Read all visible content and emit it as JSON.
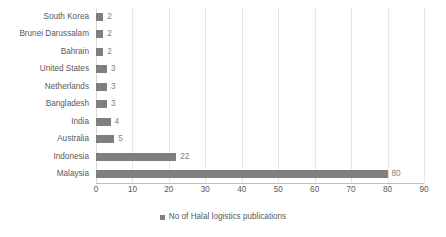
{
  "chart_data": {
    "type": "bar",
    "orientation": "horizontal",
    "title": "",
    "xlabel": "",
    "ylabel": "",
    "xlim": [
      0,
      90
    ],
    "xticks": [
      0,
      10,
      20,
      30,
      40,
      50,
      60,
      70,
      80,
      90
    ],
    "grid": true,
    "legend_position": "bottom",
    "legend": [
      "No of Halal logistics publications"
    ],
    "series_name": "No of Halal logistics publications",
    "bar_color": "#7f7f7f",
    "categories": [
      "South Korea",
      "Brunei Darussalam",
      "Bahrain",
      "United States",
      "Netherlands",
      "Bangladesh",
      "India",
      "Australia",
      "Indonesia",
      "Malaysia"
    ],
    "values": [
      2,
      2,
      2,
      3,
      3,
      3,
      4,
      5,
      22,
      80
    ],
    "data_labels": [
      "2",
      "2",
      "2",
      "3",
      "3",
      "3",
      "4",
      "5",
      "22",
      "80"
    ]
  },
  "axis": {
    "tick_labels": [
      "0",
      "10",
      "20",
      "30",
      "40",
      "50",
      "60",
      "70",
      "80",
      "90"
    ]
  },
  "legend": {
    "items": [
      {
        "label": "No of Halal logistics publications",
        "color": "#7f7f7f"
      }
    ]
  }
}
